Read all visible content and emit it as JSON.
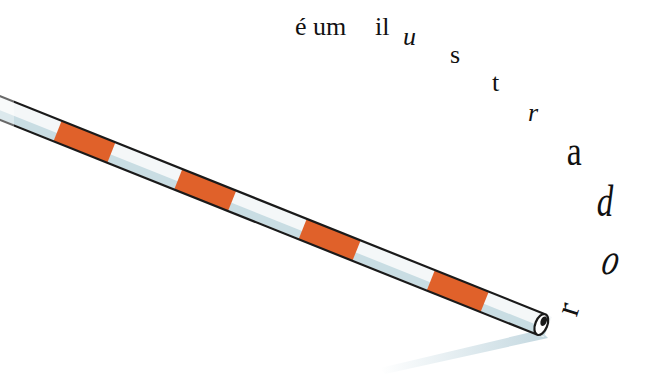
{
  "illustration": {
    "text_start": "é um",
    "text_il": "il",
    "letters": [
      "u",
      "s",
      "t",
      "r",
      "a",
      "d",
      "o",
      "r"
    ],
    "full_phrase": "é um ilustrador",
    "colors": {
      "background": "#ffffff",
      "stripe": "#e0612a",
      "tube_body": "#f4f7f8",
      "tube_shade": "#c9dde3",
      "outline": "#1a1a1a",
      "shadow": "#bcd3dc",
      "text": "#111111"
    }
  }
}
